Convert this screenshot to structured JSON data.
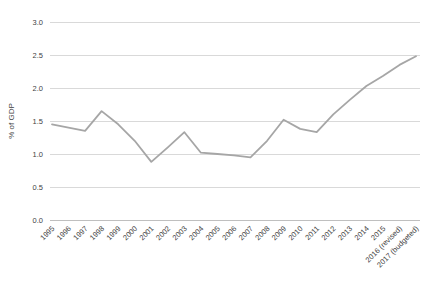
{
  "chart_data": {
    "type": "line",
    "title": "",
    "xlabel": "",
    "ylabel": "% of GDP",
    "ylim": [
      0.0,
      3.0
    ],
    "ytick_step": 0.5,
    "ytick_labels": [
      "0.0",
      "0.5",
      "1.0",
      "1.5",
      "2.0",
      "2.5",
      "3.0"
    ],
    "grid": true,
    "legend_position": "none",
    "x_label_rotation_deg": 45,
    "categories": [
      "1995",
      "1996",
      "1997",
      "1998",
      "1999",
      "2000",
      "2001",
      "2002",
      "2003",
      "2004",
      "2005",
      "2006",
      "2007",
      "2008",
      "2009",
      "2010",
      "2011",
      "2012",
      "2013",
      "2014",
      "2015",
      "2016 (revised)",
      "2017 (budgeted)"
    ],
    "series": [
      {
        "name": "% of GDP",
        "values": [
          1.45,
          1.4,
          1.35,
          1.65,
          1.45,
          1.2,
          0.88,
          1.1,
          1.33,
          1.02,
          1.0,
          0.98,
          0.95,
          1.2,
          1.52,
          1.38,
          1.33,
          1.6,
          1.82,
          2.03,
          2.18,
          2.35,
          2.48
        ]
      }
    ],
    "colors": {
      "line": "#a6a6a6",
      "gridline": "#d9d9d9",
      "axis_line": "#bfbfbf",
      "text": "#3f3f3f",
      "background": "#ffffff"
    }
  }
}
